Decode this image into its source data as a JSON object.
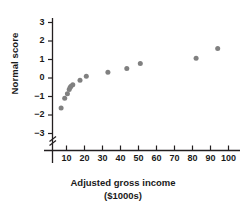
{
  "chart_data": {
    "type": "scatter",
    "title": "",
    "xlabel": "Adjusted gross income",
    "xlabel_units": "($1000s)",
    "ylabel": "Normal score",
    "x": [
      7,
      9,
      10.5,
      11.5,
      12,
      12.5,
      13.5,
      17.5,
      21,
      33,
      43.5,
      51,
      82,
      94
    ],
    "y": [
      -1.62,
      -1.09,
      -0.85,
      -0.62,
      -0.52,
      -0.44,
      -0.36,
      -0.12,
      0.1,
      0.31,
      0.52,
      0.78,
      1.07,
      1.6
    ],
    "points": [
      {
        "x": 7,
        "y": -1.62
      },
      {
        "x": 9,
        "y": -1.09
      },
      {
        "x": 10.5,
        "y": -0.85
      },
      {
        "x": 11.5,
        "y": -0.62
      },
      {
        "x": 12,
        "y": -0.52
      },
      {
        "x": 12.5,
        "y": -0.44
      },
      {
        "x": 13.5,
        "y": -0.36
      },
      {
        "x": 17.5,
        "y": -0.12
      },
      {
        "x": 21,
        "y": 0.1
      },
      {
        "x": 33,
        "y": 0.31
      },
      {
        "x": 43.5,
        "y": 0.52
      },
      {
        "x": 51,
        "y": 0.78
      },
      {
        "x": 82,
        "y": 1.07
      },
      {
        "x": 94,
        "y": 1.6
      }
    ],
    "xlim": [
      0,
      107
    ],
    "ylim": [
      -3.6,
      3.4
    ],
    "xticks": [
      10,
      20,
      30,
      40,
      50,
      60,
      70,
      80,
      90,
      100
    ],
    "xtick_labels": [
      "10",
      "20",
      "30",
      "40",
      "50",
      "60",
      "70",
      "80",
      "90",
      "100"
    ],
    "yticks": [
      3,
      2,
      1,
      0,
      -1,
      -2,
      -3
    ],
    "ytick_labels": [
      "3",
      "2",
      "1",
      "0",
      "−1",
      "−2",
      "−3"
    ],
    "grid": false,
    "legend": "none",
    "axis_break": {
      "axis": "y",
      "symbol": "zigzag",
      "below_value": -3
    },
    "marker_color": "#808080",
    "axis_color": "#231f20",
    "marker_size_px": 5
  }
}
